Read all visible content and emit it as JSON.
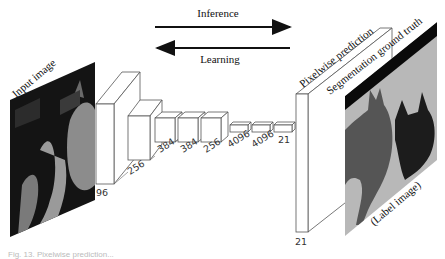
{
  "arrows": {
    "inference_label": "Inference",
    "learning_label": "Learning"
  },
  "input": {
    "label": "Input image"
  },
  "output": {
    "prediction_label": "Pixelwise prediction",
    "ground_truth_label": "Segmentation ground truth",
    "label_image_caption": "(Label image)"
  },
  "layers": [
    {
      "channels": "96"
    },
    {
      "channels": "256"
    },
    {
      "channels": "384"
    },
    {
      "channels": "384"
    },
    {
      "channels": "256"
    },
    {
      "channels": "4096"
    },
    {
      "channels": "4096"
    },
    {
      "channels": "21"
    }
  ],
  "output_layer": {
    "channels": "21"
  },
  "colors": {
    "line": "#444444",
    "label_background": "#b8b8b8",
    "label_class_a": "#555555",
    "label_class_b": "#1c1c1c",
    "label_border": "#0a0a0a"
  },
  "caption": "Fig. 13. Pixelwise prediction..."
}
